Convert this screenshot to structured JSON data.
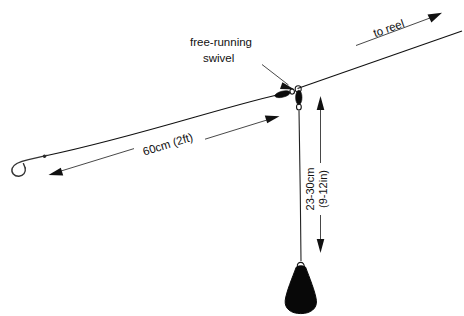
{
  "diagram": {
    "background_color": "#ffffff",
    "line_color": "#111111",
    "weight_color": "#080808"
  },
  "labels": {
    "swivel": {
      "line1": "free-running",
      "line2": "swivel"
    },
    "to_reel": "to reel",
    "leader_length": "60cm (2ft)",
    "drop_length": {
      "line1": "23-30cm",
      "line2": "(9-12in)"
    }
  },
  "components": {
    "hook_name": "fish-hook",
    "swivel_name": "free-running-swivel",
    "weight_name": "lead-weight",
    "main_line_name": "main-line-to-reel",
    "leader_name": "hook-leader-line",
    "drop_name": "weight-drop-line"
  },
  "measurements": {
    "leader": {
      "metric": "60cm",
      "imperial": "2ft"
    },
    "drop": {
      "metric": "23-30cm",
      "imperial": "9-12in"
    }
  }
}
